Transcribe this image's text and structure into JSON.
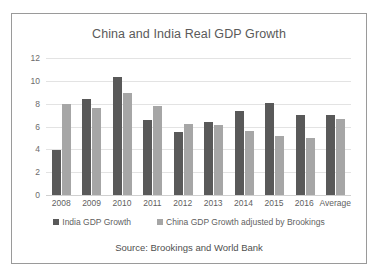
{
  "chart_data": {
    "type": "bar",
    "title": "China and India Real GDP Growth",
    "xlabel": "",
    "ylabel": "",
    "ylim": [
      0,
      12
    ],
    "yticks": [
      0,
      2,
      4,
      6,
      8,
      10,
      12
    ],
    "grid": true,
    "legend_position": "bottom",
    "categories": [
      "2008",
      "2009",
      "2010",
      "2011",
      "2012",
      "2013",
      "2014",
      "2015",
      "2016",
      "Average"
    ],
    "series": [
      {
        "name": "India GDP Growth",
        "color": "#595959",
        "values": [
          3.9,
          8.4,
          10.3,
          6.6,
          5.5,
          6.4,
          7.4,
          8.1,
          7.0,
          7.0
        ]
      },
      {
        "name": "China GDP Growth adjusted by Brookings",
        "color": "#a6a6a6",
        "values": [
          8.0,
          7.6,
          8.9,
          7.8,
          6.2,
          6.1,
          5.6,
          5.2,
          5.0,
          6.7
        ]
      }
    ],
    "source_note": "Source: Brookings and World Bank"
  }
}
